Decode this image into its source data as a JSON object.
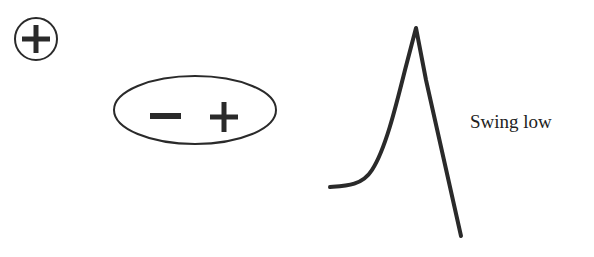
{
  "diagram": {
    "elements": [
      {
        "id": "positive-charge",
        "shape": "circle-with-plus",
        "symbol": "+"
      },
      {
        "id": "dipole",
        "shape": "ellipse",
        "symbols": [
          "−",
          "+"
        ]
      },
      {
        "id": "waveform",
        "shape": "sharp-peak-curve",
        "description": "slow rise to sharp peak then steep fall"
      }
    ],
    "label": "Swing low",
    "colors": {
      "stroke": "#2a2a2a",
      "background": "#ffffff",
      "text": "#222222"
    }
  }
}
